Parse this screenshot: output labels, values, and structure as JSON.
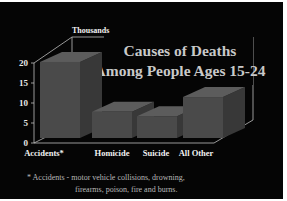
{
  "chart_data": {
    "type": "bar",
    "style": "3d",
    "title": "Causes of Deaths Among People Ages 15-24",
    "title_lines": [
      "Causes of Deaths",
      "Among People Ages 15-24"
    ],
    "ylabel": "Thousands",
    "xlabel": "",
    "categories": [
      "Accidents*",
      "Homicide",
      "Suicide",
      "All Other"
    ],
    "values": [
      19.5,
      6.7,
      5.6,
      10.5
    ],
    "ylim": [
      0,
      20
    ],
    "yticks": [
      "0",
      "5",
      "10",
      "15",
      "20"
    ],
    "grid": false,
    "legend": null,
    "footnote_lines": [
      "* Accidents - motor vehicle collisions, drowning,",
      "firearms, poison, fire and burns."
    ],
    "colors": {
      "background": "#050505",
      "bar_front": "#4a4a4a",
      "bar_top": "#5c5c5c",
      "bar_side": "#383838",
      "axis": "#bdbdbd",
      "title": "#c9c9c9",
      "footnote": "#b8b8b8"
    }
  }
}
